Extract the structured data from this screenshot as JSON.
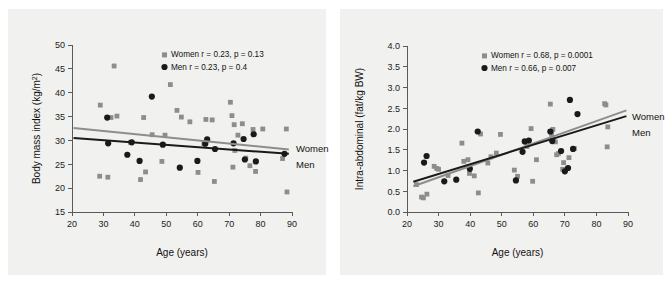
{
  "figure": {
    "background_color": "#ffffff",
    "panel_background_color": "#f1f1ef",
    "women_color": "#8d8d8d",
    "men_color": "#1a1a1a"
  },
  "panels": [
    {
      "id": "panel-a",
      "series_label_women": "Women",
      "series_label_men": "Men",
      "legend_women": "Women r = 0.23, p = 0.13",
      "legend_men": "Men r = 0.23, p = 0.4",
      "xlabel": "Age (years)",
      "ylabel": "Body mass index (kg/m²)"
    },
    {
      "id": "panel-b",
      "series_label_women": "Women",
      "series_label_men": "Men",
      "legend_women": "Women r = 0.68, p = 0.0001",
      "legend_men": "Men r = 0.66, p = 0.007",
      "xlabel": "Age (years)",
      "ylabel": "Intra-abdominal (fat/kg BW)"
    }
  ],
  "chart_data": [
    {
      "type": "scatter",
      "title": "",
      "xlabel": "Age (years)",
      "ylabel": "Body mass index (kg/m²)",
      "xlim": [
        20,
        90
      ],
      "ylim": [
        15,
        50
      ],
      "xticks": [
        20,
        30,
        40,
        50,
        60,
        70,
        80,
        90
      ],
      "yticks": [
        15,
        20,
        25,
        30,
        35,
        40,
        45,
        50
      ],
      "grid": false,
      "legend_position": "top-right-inside",
      "legend": [
        "Women r = 0.23, p = 0.13",
        "Men r = 0.23, p = 0.4"
      ],
      "annotations": [
        "Women",
        "Men"
      ],
      "series": [
        {
          "name": "Women",
          "marker": "square",
          "color": "#8d8d8d",
          "stats": {
            "r": 0.23,
            "p": 0.13
          },
          "fit_line": {
            "x": [
              20.5,
              89.0
            ],
            "y": [
              32.6,
              28.1
            ]
          },
          "points": [
            [
              28.8,
              22.5
            ],
            [
              29.0,
              37.4
            ],
            [
              31.4,
              22.3
            ],
            [
              32.4,
              34.8
            ],
            [
              33.4,
              45.6
            ],
            [
              34.3,
              35.1
            ],
            [
              38.6,
              29.6
            ],
            [
              41.8,
              21.8
            ],
            [
              42.8,
              34.8
            ],
            [
              43.4,
              23.4
            ],
            [
              45.5,
              31.2
            ],
            [
              48.6,
              25.6
            ],
            [
              49.6,
              31.1
            ],
            [
              51.3,
              41.7
            ],
            [
              53.4,
              36.3
            ],
            [
              54.8,
              34.9
            ],
            [
              57.5,
              33.9
            ],
            [
              60.1,
              23.3
            ],
            [
              62.0,
              29.3
            ],
            [
              62.6,
              34.4
            ],
            [
              64.6,
              34.3
            ],
            [
              65.3,
              21.4
            ],
            [
              70.4,
              38.0
            ],
            [
              70.9,
              35.2
            ],
            [
              71.2,
              24.4
            ],
            [
              71.6,
              33.3
            ],
            [
              71.8,
              27.9
            ],
            [
              72.8,
              31.1
            ],
            [
              74.2,
              33.5
            ],
            [
              75.3,
              26.3
            ],
            [
              76.6,
              24.7
            ],
            [
              77.6,
              32.3
            ],
            [
              78.4,
              23.5
            ],
            [
              80.7,
              32.4
            ],
            [
              87.0,
              26.2
            ],
            [
              88.2,
              32.4
            ],
            [
              88.4,
              19.2
            ]
          ]
        },
        {
          "name": "Men",
          "marker": "circle",
          "color": "#1a1a1a",
          "stats": {
            "r": 0.23,
            "p": 0.4
          },
          "fit_line": {
            "x": [
              20.5,
              89.0
            ],
            "y": [
              30.5,
              27.2
            ]
          },
          "points": [
            [
              31.2,
              34.8
            ],
            [
              31.5,
              29.4
            ],
            [
              37.6,
              27.0
            ],
            [
              39.0,
              29.6
            ],
            [
              41.5,
              25.7
            ],
            [
              45.4,
              39.2
            ],
            [
              48.9,
              29.1
            ],
            [
              54.3,
              24.3
            ],
            [
              59.9,
              25.7
            ],
            [
              62.4,
              29.3
            ],
            [
              63.0,
              30.2
            ],
            [
              65.5,
              28.2
            ],
            [
              71.4,
              29.4
            ],
            [
              74.6,
              30.3
            ],
            [
              75.0,
              26.0
            ],
            [
              77.8,
              31.3
            ],
            [
              78.5,
              25.6
            ],
            [
              87.6,
              27.2
            ]
          ]
        }
      ]
    },
    {
      "type": "scatter",
      "title": "",
      "xlabel": "Age (years)",
      "ylabel": "Intra-abdominal (fat/kg BW)",
      "xlim": [
        20,
        90
      ],
      "ylim": [
        0.0,
        4.0
      ],
      "xticks": [
        20,
        30,
        40,
        50,
        60,
        70,
        80,
        90
      ],
      "yticks": [
        0.0,
        0.5,
        1.0,
        1.5,
        2.0,
        2.5,
        3.0,
        3.5,
        4.0
      ],
      "grid": false,
      "legend_position": "top-right-inside",
      "legend": [
        "Women r = 0.68, p = 0.0001",
        "Men r = 0.66, p = 0.007"
      ],
      "annotations": [
        "Women",
        "Men"
      ],
      "series": [
        {
          "name": "Women",
          "marker": "square",
          "color": "#8d8d8d",
          "stats": {
            "r": 0.68,
            "p": 0.0001
          },
          "fit_line": {
            "x": [
              22.0,
              89.5
            ],
            "y": [
              0.62,
              2.45
            ]
          },
          "points": [
            [
              23.0,
              0.66
            ],
            [
              24.6,
              0.36
            ],
            [
              25.2,
              0.34
            ],
            [
              26.3,
              0.43
            ],
            [
              28.6,
              1.1
            ],
            [
              29.4,
              1.05
            ],
            [
              30.0,
              1.03
            ],
            [
              33.0,
              0.88
            ],
            [
              37.4,
              1.66
            ],
            [
              38.0,
              1.22
            ],
            [
              39.3,
              1.26
            ],
            [
              39.8,
              0.93
            ],
            [
              41.3,
              0.87
            ],
            [
              42.6,
              0.46
            ],
            [
              43.3,
              1.88
            ],
            [
              45.6,
              1.18
            ],
            [
              46.6,
              1.33
            ],
            [
              48.3,
              1.42
            ],
            [
              49.6,
              1.87
            ],
            [
              54.0,
              1.01
            ],
            [
              55.0,
              0.86
            ],
            [
              57.4,
              1.7
            ],
            [
              58.0,
              1.58
            ],
            [
              59.3,
              2.01
            ],
            [
              59.8,
              0.74
            ],
            [
              61.0,
              1.26
            ],
            [
              65.4,
              2.6
            ],
            [
              65.8,
              1.87
            ],
            [
              66.2,
              1.99
            ],
            [
              66.5,
              1.74
            ],
            [
              67.0,
              1.69
            ],
            [
              67.4,
              1.38
            ],
            [
              68.0,
              1.41
            ],
            [
              69.3,
              1.03
            ],
            [
              69.6,
              1.19
            ],
            [
              71.3,
              1.31
            ],
            [
              73.0,
              1.53
            ],
            [
              82.6,
              2.61
            ],
            [
              83.0,
              2.58
            ],
            [
              83.4,
              1.57
            ],
            [
              83.6,
              2.05
            ]
          ]
        },
        {
          "name": "Men",
          "marker": "circle",
          "color": "#1a1a1a",
          "stats": {
            "r": 0.66,
            "p": 0.007
          },
          "fit_line": {
            "x": [
              22.0,
              89.5
            ],
            "y": [
              0.73,
              2.31
            ]
          },
          "points": [
            [
              25.4,
              1.19
            ],
            [
              26.2,
              1.35
            ],
            [
              31.8,
              0.74
            ],
            [
              35.6,
              0.78
            ],
            [
              39.9,
              1.04
            ],
            [
              42.4,
              1.94
            ],
            [
              54.5,
              0.76
            ],
            [
              56.6,
              1.45
            ],
            [
              57.3,
              1.7
            ],
            [
              58.6,
              1.72
            ],
            [
              65.4,
              1.94
            ],
            [
              66.0,
              1.71
            ],
            [
              68.8,
              1.47
            ],
            [
              70.0,
              0.98
            ],
            [
              71.0,
              1.06
            ],
            [
              71.6,
              2.7
            ],
            [
              72.6,
              1.52
            ],
            [
              74.0,
              2.36
            ]
          ]
        }
      ]
    }
  ]
}
